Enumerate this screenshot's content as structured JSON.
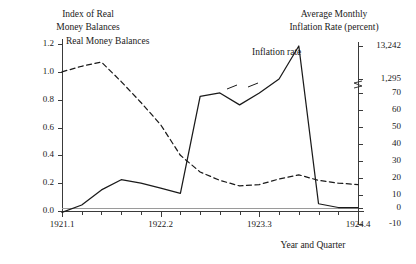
{
  "chart_data": {
    "type": "line",
    "title": "",
    "xlabel": "Year and Quarter",
    "left_axis_title": "Index of Real\nMoney Balances",
    "right_axis_title": "Average Monthly\nInflation Rate (percent)",
    "grid": false,
    "legend_position": "inline-annotation",
    "x_tick_labels": [
      "1921.1",
      "1922.2",
      "1923.3",
      "1924.4"
    ],
    "x_categories": [
      "1921.1",
      "1921.2",
      "1921.3",
      "1921.4",
      "1922.1",
      "1922.2",
      "1922.3",
      "1922.4",
      "1923.1",
      "1923.2",
      "1923.3",
      "1923.4",
      "1924.1",
      "1924.2",
      "1924.3",
      "1924.4"
    ],
    "left_axis": {
      "label": "Index of Real Money Balances",
      "ticks": [
        "0.0",
        "0.2",
        "0.4",
        "0.6",
        "0.8",
        "1.0",
        "1.2"
      ],
      "tick_values": [
        0.0,
        0.2,
        0.4,
        0.6,
        0.8,
        1.0,
        1.2
      ],
      "ylim": [
        0.0,
        1.2
      ]
    },
    "right_axis": {
      "label": "Average Monthly Inflation Rate (percent)",
      "ticks": [
        "13,242",
        "1,295",
        "70",
        "60",
        "50",
        "40",
        "30",
        "20",
        "10",
        "0",
        "-10"
      ],
      "tick_values": [
        13242,
        1295,
        70,
        60,
        50,
        40,
        30,
        20,
        10,
        0,
        -10
      ],
      "broken_scale": true,
      "break_between": [
        "1,295",
        "70"
      ]
    },
    "series": [
      {
        "name": "Real Money Balances",
        "axis": "left",
        "style": "dashed",
        "color": "#1a1a1a",
        "values": [
          1.0,
          1.04,
          1.07,
          0.93,
          0.78,
          0.62,
          0.4,
          0.28,
          0.22,
          0.18,
          0.19,
          0.23,
          0.26,
          0.22,
          0.2,
          0.19
        ]
      },
      {
        "name": "Inflation rate",
        "axis": "right",
        "style": "solid",
        "color": "#1a1a1a",
        "values": [
          -3,
          2,
          13,
          19,
          17,
          14,
          11,
          68,
          75,
          63,
          70,
          1295,
          13242,
          3,
          0,
          0
        ]
      }
    ],
    "annotations": [
      {
        "text": "Real Money Balances",
        "x": 66,
        "y": 36
      },
      {
        "text": "Inflation rate",
        "x": 252,
        "y": 47
      }
    ]
  },
  "colors": {
    "ink": "#1a1a1a",
    "axis": "#3a3a3a",
    "baseline": "#9a9a9a",
    "background": "#ffffff"
  }
}
